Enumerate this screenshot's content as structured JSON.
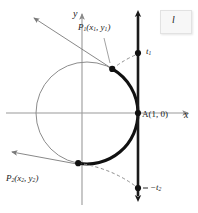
{
  "figure": {
    "kind": "unit-circle-wrapping-diagram",
    "background_color": "#ffffff",
    "axes": {
      "x_label": "x",
      "y_label": "y",
      "axis_color": "#9a9a9a"
    },
    "circle": {
      "label": "unit circle",
      "stroke_color": "#8c8c8c",
      "center_x": 87,
      "center_y": 113,
      "radius": 51
    },
    "tangent_line": {
      "label": "l",
      "stroke_color": "#1a1a1a",
      "x_position": 138
    },
    "points": [
      {
        "name": "P1",
        "label": "P",
        "sub": "1",
        "coords": "(x",
        "coords_sub1": "1",
        "coords_mid": ", y",
        "coords_sub2": "1",
        "coords_end": ")"
      },
      {
        "name": "P2",
        "label": "P",
        "sub": "2",
        "coords": "(x",
        "coords_sub1": "2",
        "coords_mid": ", y",
        "coords_sub2": "2",
        "coords_end": ")"
      },
      {
        "name": "A",
        "label": "A(1, 0)"
      }
    ],
    "labels": {
      "p1_main": "P",
      "p1_sub": "1",
      "p1_open": "(x",
      "p1_sub_x": "1",
      "p1_comma": ", y",
      "p1_sub_y": "1",
      "p1_close": ")",
      "p2_main": "P",
      "p2_sub": "2",
      "p2_open": "(x",
      "p2_sub_x": "2",
      "p2_comma": ", y",
      "p2_sub_y": "2",
      "p2_close": ")",
      "a_point": "A(1, 0)",
      "t1_main": "t",
      "t1_sub": "1",
      "t2_prefix": "−t",
      "t2_sub": "2",
      "line_l": "l",
      "axis_x": "x",
      "axis_y": "y"
    },
    "arc": {
      "description": "thick arc of circle from P1 through A to P2",
      "stroke_color": "#111111"
    },
    "dashed_curves": {
      "description": "dashed wrap arcs from P1 to t1 and from P2 to -t2",
      "stroke_color": "#8c8c8c"
    },
    "pointer_arrows": {
      "description": "leader arrows from P1 and P2 toward upper-left and left",
      "stroke_color": "#7a7a7a"
    }
  }
}
